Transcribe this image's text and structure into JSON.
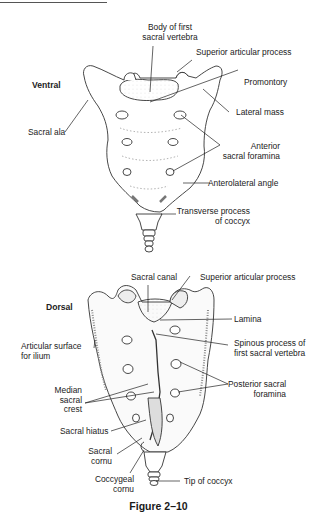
{
  "figure": {
    "caption": "Figure 2–10",
    "ventral": {
      "view_label": "Ventral",
      "labels": {
        "body_first_sacral_1": "Body of first",
        "body_first_sacral_2": "sacral vertebra",
        "superior_articular_process": "Superior articular process",
        "promontory": "Promontory",
        "lateral_mass": "Lateral mass",
        "sacral_ala": "Sacral ala",
        "anterior_sacral_foramina_1": "Anterior",
        "anterior_sacral_foramina_2": "sacral foramina",
        "anterolateral_angle": "Anterolateral angle",
        "transverse_process_1": "Transverse process",
        "transverse_process_2": "of coccyx"
      }
    },
    "dorsal": {
      "view_label": "Dorsal",
      "labels": {
        "sacral_canal": "Sacral canal",
        "superior_articular_process": "Superior articular process",
        "lamina": "Lamina",
        "articular_surface_1": "Articular surface",
        "articular_surface_2": "for ilium",
        "spinous_process_1": "Spinous process of",
        "spinous_process_2": "first sacral vertebra",
        "median_sacral_crest_1": "Median",
        "median_sacral_crest_2": "sacral",
        "median_sacral_crest_3": "crest",
        "posterior_sacral_foramina_1": "Posterior sacral",
        "posterior_sacral_foramina_2": "foramina",
        "sacral_hiatus": "Sacral hiatus",
        "sacral_cornu_1": "Sacral",
        "sacral_cornu_2": "cornu",
        "coccygeal_cornu_1": "Coccygeal",
        "coccygeal_cornu_2": "cornu",
        "tip_of_coccyx": "Tip of coccyx"
      }
    }
  }
}
